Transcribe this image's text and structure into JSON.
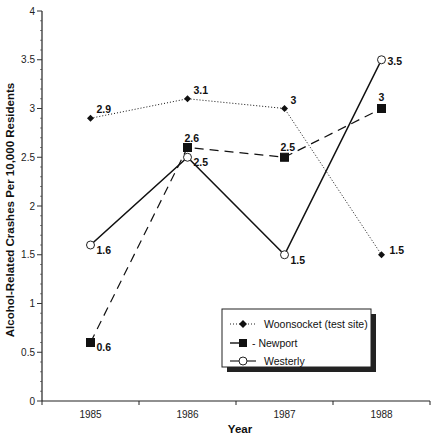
{
  "chart_data": {
    "type": "line",
    "title": "",
    "xlabel": "Year",
    "ylabel": "Alcohol-Related Crashes Per 10,000 Residents",
    "categories": [
      "1985",
      "1986",
      "1987",
      "1988"
    ],
    "ylim": [
      0,
      4
    ],
    "yticks": [
      "0",
      "0.5",
      "1",
      "1.5",
      "2",
      "2.5",
      "3",
      "3.5",
      "4"
    ],
    "grid": false,
    "legend_position": "lower right",
    "series": [
      {
        "name": "Woonsocket (test site)",
        "values": [
          2.9,
          3.1,
          3.0,
          1.5
        ],
        "labels": [
          "2.9",
          "3.1",
          "3",
          "1.5"
        ],
        "style": "dotted",
        "marker": "diamond"
      },
      {
        "name": "Newport",
        "values": [
          0.6,
          2.6,
          2.5,
          3.0
        ],
        "labels": [
          "0.6",
          "2.6",
          "2.5",
          "3"
        ],
        "style": "dashed",
        "marker": "filled-square"
      },
      {
        "name": "Westerly",
        "values": [
          1.6,
          2.5,
          1.5,
          3.5
        ],
        "labels": [
          "1.6",
          "2.5",
          "1.5",
          "3.5"
        ],
        "style": "solid",
        "marker": "open-circle"
      }
    ]
  },
  "legend": {
    "items": [
      "Woonsocket (test site)",
      "- Newport",
      "Westerly"
    ]
  }
}
